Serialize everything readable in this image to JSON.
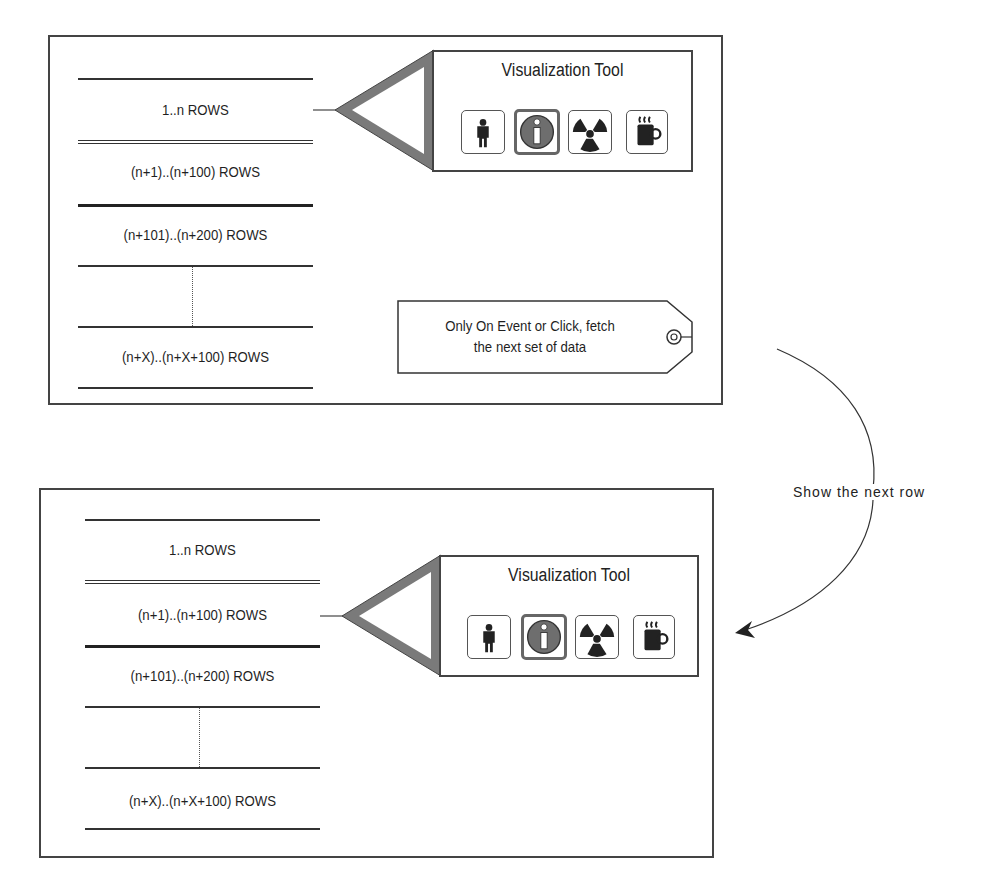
{
  "panels": [
    {
      "id": "before",
      "rows": [
        {
          "label": "1..n ROWS"
        },
        {
          "label": "(n+1)..(n+100) ROWS"
        },
        {
          "label": "(n+101)..(n+200) ROWS"
        },
        {
          "label": ""
        },
        {
          "label": "(n+X)..(n+X+100) ROWS"
        }
      ],
      "pointer_row_index": 0,
      "tool": {
        "title": "Visualization Tool",
        "icons": [
          {
            "name": "person-icon",
            "active": false
          },
          {
            "name": "info-icon",
            "active": true
          },
          {
            "name": "radiation-icon",
            "active": false
          },
          {
            "name": "coffee-mug-icon",
            "active": false
          }
        ]
      },
      "tag": {
        "line1": "Only On Event or Click, fetch",
        "line2": "the next set of data"
      }
    },
    {
      "id": "after",
      "rows": [
        {
          "label": "1..n ROWS"
        },
        {
          "label": "(n+1)..(n+100) ROWS"
        },
        {
          "label": "(n+101)..(n+200) ROWS"
        },
        {
          "label": ""
        },
        {
          "label": "(n+X)..(n+X+100) ROWS"
        }
      ],
      "pointer_row_index": 1,
      "tool": {
        "title": "Visualization Tool",
        "icons": [
          {
            "name": "person-icon",
            "active": false
          },
          {
            "name": "info-icon",
            "active": true
          },
          {
            "name": "radiation-icon",
            "active": false
          },
          {
            "name": "coffee-mug-icon",
            "active": false
          }
        ]
      }
    }
  ],
  "transition": {
    "label": "Show the next row"
  },
  "colors": {
    "stroke": "#444444",
    "pointer_fill": "#777777",
    "icon_fill": "#222222",
    "info_fill": "#6e6e6e"
  }
}
